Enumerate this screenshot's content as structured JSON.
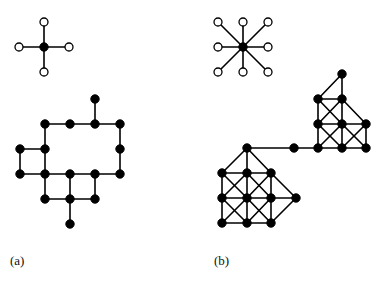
{
  "figure": {
    "background": "#ffffff",
    "ink_color": "#000000",
    "node_fill_filled": "#000000",
    "node_fill_open": "#ffffff",
    "node_stroke": "#000000",
    "edge_color": "#000000",
    "node_radius": 4.2,
    "open_node_radius": 4.0,
    "edge_width": 1.6
  },
  "panels": [
    {
      "id": "a",
      "label": "(a)",
      "motif": {
        "name": "von-neumann-neighbourhood",
        "center": {
          "x": 44,
          "y": 47,
          "type": "filled"
        },
        "neighbors": [
          {
            "x": 44,
            "y": 22,
            "type": "open"
          },
          {
            "x": 69,
            "y": 47,
            "type": "open"
          },
          {
            "x": 44,
            "y": 72,
            "type": "open"
          },
          {
            "x": 19,
            "y": 47,
            "type": "open"
          }
        ],
        "edges": [
          [
            0,
            1
          ],
          [
            0,
            2
          ],
          [
            0,
            3
          ],
          [
            0,
            4
          ]
        ]
      },
      "graph": {
        "name": "site-animal-square-lattice",
        "nodes": [
          {
            "id": 0,
            "x": 95,
            "y": 99
          },
          {
            "id": 1,
            "x": 45,
            "y": 124
          },
          {
            "id": 2,
            "x": 70,
            "y": 124
          },
          {
            "id": 3,
            "x": 95,
            "y": 124
          },
          {
            "id": 4,
            "x": 120,
            "y": 124
          },
          {
            "id": 5,
            "x": 20,
            "y": 149
          },
          {
            "id": 6,
            "x": 45,
            "y": 149
          },
          {
            "id": 7,
            "x": 120,
            "y": 149
          },
          {
            "id": 8,
            "x": 20,
            "y": 174
          },
          {
            "id": 9,
            "x": 45,
            "y": 174
          },
          {
            "id": 10,
            "x": 70,
            "y": 174
          },
          {
            "id": 11,
            "x": 95,
            "y": 174
          },
          {
            "id": 12,
            "x": 120,
            "y": 174
          },
          {
            "id": 13,
            "x": 45,
            "y": 199
          },
          {
            "id": 14,
            "x": 70,
            "y": 199
          },
          {
            "id": 15,
            "x": 95,
            "y": 199
          },
          {
            "id": 16,
            "x": 70,
            "y": 224
          }
        ],
        "edges": [
          [
            0,
            3
          ],
          [
            1,
            2
          ],
          [
            2,
            3
          ],
          [
            3,
            4
          ],
          [
            1,
            6
          ],
          [
            4,
            7
          ],
          [
            5,
            6
          ],
          [
            5,
            8
          ],
          [
            6,
            9
          ],
          [
            7,
            12
          ],
          [
            8,
            9
          ],
          [
            9,
            10
          ],
          [
            10,
            11
          ],
          [
            11,
            12
          ],
          [
            9,
            13
          ],
          [
            10,
            14
          ],
          [
            11,
            15
          ],
          [
            13,
            14
          ],
          [
            14,
            15
          ],
          [
            14,
            16
          ]
        ]
      }
    },
    {
      "id": "b",
      "label": "(b)",
      "motif": {
        "name": "moore-neighbourhood",
        "center": {
          "x": 243,
          "y": 47,
          "type": "filled"
        },
        "neighbors": [
          {
            "x": 218,
            "y": 22,
            "type": "open"
          },
          {
            "x": 243,
            "y": 22,
            "type": "open"
          },
          {
            "x": 268,
            "y": 22,
            "type": "open"
          },
          {
            "x": 268,
            "y": 47,
            "type": "open"
          },
          {
            "x": 268,
            "y": 72,
            "type": "open"
          },
          {
            "x": 243,
            "y": 72,
            "type": "open"
          },
          {
            "x": 218,
            "y": 72,
            "type": "open"
          },
          {
            "x": 218,
            "y": 47,
            "type": "open"
          }
        ],
        "edges": [
          [
            0,
            1
          ],
          [
            0,
            2
          ],
          [
            0,
            3
          ],
          [
            0,
            4
          ],
          [
            0,
            5
          ],
          [
            0,
            6
          ],
          [
            0,
            7
          ],
          [
            0,
            8
          ]
        ]
      },
      "graph": {
        "name": "site-animal-king-lattice",
        "nodes": [
          {
            "id": 0,
            "x": 342,
            "y": 74
          },
          {
            "id": 1,
            "x": 318,
            "y": 99
          },
          {
            "id": 2,
            "x": 342,
            "y": 99
          },
          {
            "id": 3,
            "x": 318,
            "y": 124
          },
          {
            "id": 4,
            "x": 342,
            "y": 124
          },
          {
            "id": 5,
            "x": 366,
            "y": 124
          },
          {
            "id": 6,
            "x": 318,
            "y": 148
          },
          {
            "id": 7,
            "x": 342,
            "y": 148
          },
          {
            "id": 8,
            "x": 366,
            "y": 148
          },
          {
            "id": 9,
            "x": 294,
            "y": 148
          },
          {
            "id": 10,
            "x": 247,
            "y": 148
          },
          {
            "id": 11,
            "x": 222,
            "y": 173
          },
          {
            "id": 12,
            "x": 247,
            "y": 173
          },
          {
            "id": 13,
            "x": 271,
            "y": 173
          },
          {
            "id": 14,
            "x": 222,
            "y": 198
          },
          {
            "id": 15,
            "x": 247,
            "y": 198
          },
          {
            "id": 16,
            "x": 271,
            "y": 198
          },
          {
            "id": 17,
            "x": 296,
            "y": 198
          },
          {
            "id": 18,
            "x": 222,
            "y": 223
          },
          {
            "id": 19,
            "x": 247,
            "y": 223
          },
          {
            "id": 20,
            "x": 271,
            "y": 223
          }
        ],
        "edges": [
          [
            0,
            1
          ],
          [
            0,
            2
          ],
          [
            1,
            2
          ],
          [
            1,
            3
          ],
          [
            1,
            4
          ],
          [
            2,
            3
          ],
          [
            2,
            4
          ],
          [
            2,
            5
          ],
          [
            3,
            4
          ],
          [
            4,
            5
          ],
          [
            3,
            6
          ],
          [
            3,
            7
          ],
          [
            4,
            6
          ],
          [
            4,
            7
          ],
          [
            4,
            8
          ],
          [
            5,
            7
          ],
          [
            5,
            8
          ],
          [
            6,
            7
          ],
          [
            7,
            8
          ],
          [
            6,
            9
          ],
          [
            9,
            10
          ],
          [
            10,
            11
          ],
          [
            10,
            12
          ],
          [
            10,
            13
          ],
          [
            11,
            12
          ],
          [
            12,
            13
          ],
          [
            11,
            14
          ],
          [
            11,
            15
          ],
          [
            12,
            14
          ],
          [
            12,
            15
          ],
          [
            12,
            16
          ],
          [
            13,
            15
          ],
          [
            13,
            16
          ],
          [
            13,
            17
          ],
          [
            14,
            15
          ],
          [
            15,
            16
          ],
          [
            16,
            17
          ],
          [
            14,
            18
          ],
          [
            14,
            19
          ],
          [
            15,
            18
          ],
          [
            15,
            19
          ],
          [
            15,
            20
          ],
          [
            16,
            19
          ],
          [
            16,
            20
          ],
          [
            17,
            20
          ],
          [
            18,
            19
          ],
          [
            19,
            20
          ]
        ]
      }
    }
  ]
}
